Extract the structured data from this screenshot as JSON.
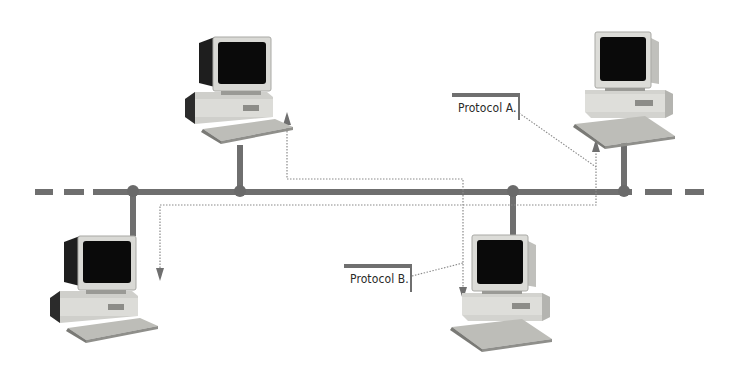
{
  "diagram": {
    "title": "",
    "type": "bus-network-topology",
    "colors": {
      "bus": "#6f6f6f",
      "dotted_path": "#8a8a8a",
      "monitor_frame": "#d8d8d4",
      "screen": "#0a0a0a",
      "case": "#cfcfcb",
      "case_dark": "#2a2a2a",
      "keyboard": "#bdbdb8"
    },
    "bus": {
      "y": 192,
      "dashes_left": [
        [
          35,
          53
        ],
        [
          64,
          84
        ],
        [
          93,
          600
        ]
      ],
      "dashes_right": [
        [
          645,
          672
        ],
        [
          685,
          704
        ]
      ]
    },
    "nodes": [
      {
        "id": "pc-top-left",
        "icon": "desktop-computer-icon",
        "junction_x": 240
      },
      {
        "id": "pc-top-right",
        "icon": "desktop-computer-icon",
        "junction_x": 624
      },
      {
        "id": "pc-bottom-left",
        "icon": "desktop-computer-icon",
        "junction_x": 133
      },
      {
        "id": "pc-bottom-right",
        "icon": "desktop-computer-icon",
        "junction_x": 513
      }
    ],
    "labels": {
      "protocol_a": "Protocol A.",
      "protocol_b": "Protocol B."
    },
    "paths": [
      {
        "name": "protocol-a-path",
        "from": "pc-bottom-left",
        "to": "pc-top-right",
        "style": "dotted"
      },
      {
        "name": "protocol-b-path",
        "from": "pc-top-left",
        "to": "pc-bottom-right",
        "style": "dotted"
      }
    ]
  }
}
